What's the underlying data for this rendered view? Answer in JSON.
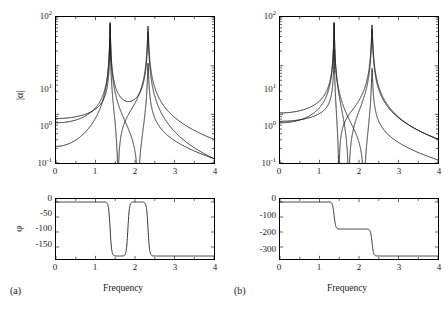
{
  "figure": {
    "width": 448,
    "height": 311,
    "background": "#ffffff",
    "line_color": "#1a1a1a"
  },
  "panels": [
    {
      "tag": "(a)",
      "magnitude": {
        "ylabel": "|α|",
        "ytick_labels": [
          "10",
          "10",
          "10"
        ],
        "ytick_exponents": [
          "2",
          "1",
          "-1"
        ],
        "ytick_values": [
          100,
          10,
          1,
          0.1
        ],
        "ylim": [
          0.1,
          100
        ],
        "yscale": "log"
      },
      "phase": {
        "ylabel": "φ",
        "ytick_labels": [
          "0",
          "-50",
          "-100",
          "-150"
        ],
        "ytick_values": [
          0,
          -50,
          -100,
          -150
        ],
        "ylim": [
          -190,
          10
        ]
      },
      "xlabel": "Frequency",
      "xtick_labels": [
        "0",
        "1",
        "2",
        "3",
        "4"
      ],
      "xtick_values": [
        0,
        1,
        2,
        3,
        4
      ],
      "xlim": [
        0,
        4
      ]
    },
    {
      "tag": "(b)",
      "magnitude": {
        "ylabel": "",
        "ytick_labels": [
          "10",
          "10",
          "10"
        ],
        "ytick_exponents": [
          "2",
          "1",
          "-1"
        ],
        "ytick_values": [
          100,
          10,
          1,
          0.1
        ],
        "ylim": [
          0.1,
          100
        ],
        "yscale": "log"
      },
      "phase": {
        "ylabel": "",
        "ytick_labels": [
          "0",
          "-100",
          "-200",
          "-300"
        ],
        "ytick_values": [
          0,
          -100,
          -200,
          -300
        ],
        "ylim": [
          -380,
          20
        ]
      },
      "xlabel": "Frequency",
      "xtick_labels": [
        "0",
        "1",
        "2",
        "3",
        "4"
      ],
      "xtick_values": [
        0,
        1,
        2,
        3,
        4
      ],
      "xlim": [
        0,
        4
      ]
    }
  ],
  "chart_data": {
    "type": "line",
    "title": "",
    "xlabel": "Frequency",
    "ylabel": "|α|",
    "xlim": [
      0,
      4
    ],
    "ylim": [
      0.1,
      100
    ],
    "yscale": "log",
    "grid": false,
    "legend": "none",
    "modes": [
      {
        "natural_frequency": 1.37,
        "damping_ratio": 0.004
      },
      {
        "natural_frequency": 2.33,
        "damping_ratio": 0.004
      }
    ],
    "panels": [
      {
        "tag": "(a)",
        "antiresonance": 1.82,
        "phase_steps": [
          {
            "frequency": 0.0,
            "phase": 0
          },
          {
            "frequency": 1.37,
            "phase": -180
          },
          {
            "frequency": 1.82,
            "phase": 0
          },
          {
            "frequency": 2.33,
            "phase": -180
          },
          {
            "frequency": 4.0,
            "phase": -180
          }
        ],
        "series": [
          {
            "name": "curve-1",
            "dc_value": 1.0,
            "residues": [
              0.62,
              0.4
            ],
            "signs": [
              1,
              -1
            ],
            "has_antiresonance": true
          },
          {
            "name": "curve-2",
            "dc_value": 0.52,
            "residues": [
              0.3,
              0.52
            ],
            "signs": [
              1,
              1
            ],
            "has_antiresonance": false
          },
          {
            "name": "curve-3",
            "dc_value": 0.37,
            "residues": [
              0.58,
              0.09
            ],
            "signs": [
              1,
              1
            ],
            "has_antiresonance": false
          }
        ]
      },
      {
        "tag": "(b)",
        "antiresonance": null,
        "phase_steps": [
          {
            "frequency": 0.0,
            "phase": 0
          },
          {
            "frequency": 1.37,
            "phase": -180
          },
          {
            "frequency": 2.33,
            "phase": -360
          },
          {
            "frequency": 4.0,
            "phase": -360
          }
        ],
        "series": [
          {
            "name": "curve-1",
            "dc_value": 1.0,
            "residues": [
              0.62,
              0.45
            ],
            "signs": [
              1,
              1
            ],
            "has_antiresonance": false
          },
          {
            "name": "curve-2",
            "dc_value": 0.52,
            "residues": [
              0.17,
              0.55
            ],
            "signs": [
              1,
              1
            ],
            "has_antiresonance": false
          },
          {
            "name": "curve-3",
            "dc_value": 0.3,
            "residues": [
              0.6,
              0.07
            ],
            "signs": [
              1,
              1
            ],
            "has_antiresonance": false
          }
        ]
      }
    ]
  }
}
